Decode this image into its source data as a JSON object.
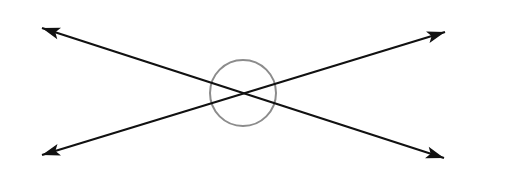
{
  "diagram": {
    "type": "intersecting-lines-with-angle-circle",
    "background": "#ffffff",
    "line_color": "#111111",
    "circle_color": "#8c8c8c",
    "intersection": {
      "x": 243,
      "y": 93
    },
    "circle": {
      "cx": 243,
      "cy": 93,
      "r": 33
    },
    "lines": [
      {
        "name": "line-a",
        "from": {
          "x": 42,
          "y": 28
        },
        "to": {
          "x": 444,
          "y": 158
        }
      },
      {
        "name": "line-b",
        "from": {
          "x": 42,
          "y": 155
        },
        "to": {
          "x": 445,
          "y": 32
        }
      }
    ]
  }
}
